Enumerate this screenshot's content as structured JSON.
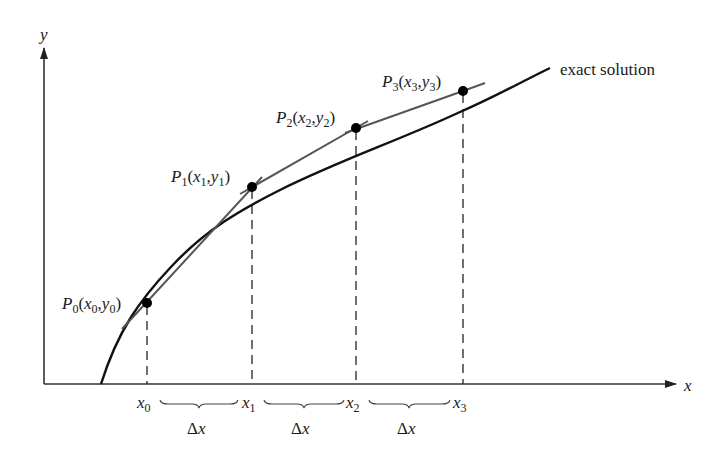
{
  "figure": {
    "axes": {
      "x_label": "x",
      "y_label": "y"
    },
    "curve_label": "exact solution",
    "points": [
      {
        "name": "P",
        "sub": "0",
        "x_sym": "x",
        "y_sym": "y",
        "label_open": "(",
        "label_sep": ",",
        "label_close": ")"
      },
      {
        "name": "P",
        "sub": "1",
        "x_sym": "x",
        "y_sym": "y",
        "label_open": "(",
        "label_sep": ",",
        "label_close": ")"
      },
      {
        "name": "P",
        "sub": "2",
        "x_sym": "x",
        "y_sym": "y",
        "label_open": "(",
        "label_sep": ",",
        "label_close": ")"
      },
      {
        "name": "P",
        "sub": "3",
        "x_sym": "x",
        "y_sym": "y",
        "label_open": "(",
        "label_sep": ",",
        "label_close": ")"
      }
    ],
    "x_ticks": [
      {
        "sym": "x",
        "sub": "0"
      },
      {
        "sym": "x",
        "sub": "1"
      },
      {
        "sym": "x",
        "sub": "2"
      },
      {
        "sym": "x",
        "sub": "3"
      }
    ],
    "step_labels": [
      {
        "delta": "Δ",
        "sym": "x"
      },
      {
        "delta": "Δ",
        "sym": "x"
      },
      {
        "delta": "Δ",
        "sym": "x"
      }
    ],
    "colors": {
      "exact_curve": "#111111",
      "euler_segments": "#555555",
      "axes": "#333333",
      "points": "#000000"
    }
  }
}
